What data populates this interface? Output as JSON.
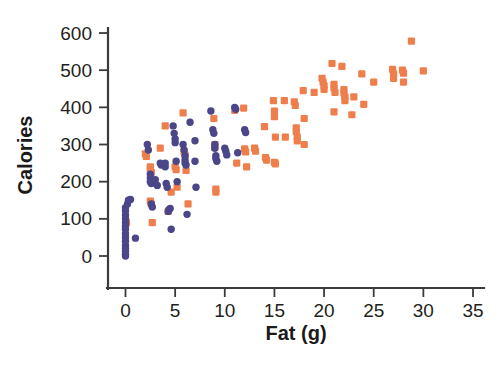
{
  "chart_data": {
    "type": "scatter",
    "title": "",
    "xlabel": "Fat (g)",
    "ylabel": "Calories",
    "xlim": [
      -2.2,
      36.5
    ],
    "ylim": [
      -35,
      630
    ],
    "xticks": [
      0,
      5,
      10,
      15,
      20,
      25,
      30,
      35
    ],
    "yticks": [
      0,
      100,
      200,
      300,
      400,
      500,
      600
    ],
    "xtick_labels": [
      "0",
      "5",
      "10",
      "15",
      "20",
      "25",
      "30",
      "35"
    ],
    "ytick_labels": [
      "0",
      "100",
      "200",
      "300",
      "400",
      "500",
      "600"
    ],
    "grid": false,
    "legend": "none",
    "series": [
      {
        "name": "purple-circles",
        "marker": "circle",
        "color": "#4a4688",
        "points": [
          [
            0,
            0
          ],
          [
            0,
            5
          ],
          [
            0,
            12
          ],
          [
            0,
            20
          ],
          [
            0,
            28
          ],
          [
            0,
            40
          ],
          [
            0,
            50
          ],
          [
            0,
            60
          ],
          [
            0,
            72
          ],
          [
            0,
            80
          ],
          [
            0,
            90
          ],
          [
            0,
            100
          ],
          [
            0,
            110
          ],
          [
            0,
            122
          ],
          [
            0,
            130
          ],
          [
            0.2,
            140
          ],
          [
            0.3,
            150
          ],
          [
            0.5,
            152
          ],
          [
            1.0,
            48
          ],
          [
            2.2,
            300
          ],
          [
            2.3,
            285
          ],
          [
            2.5,
            210
          ],
          [
            2.5,
            200
          ],
          [
            2.5,
            220
          ],
          [
            2.6,
            195
          ],
          [
            2.6,
            140
          ],
          [
            2.7,
            132
          ],
          [
            3.0,
            205
          ],
          [
            3.2,
            190
          ],
          [
            3.5,
            250
          ],
          [
            3.6,
            245
          ],
          [
            4.0,
            250
          ],
          [
            4.0,
            240
          ],
          [
            4.1,
            195
          ],
          [
            4.2,
            185
          ],
          [
            4.3,
            120
          ],
          [
            4.4,
            125
          ],
          [
            4.5,
            128
          ],
          [
            4.6,
            72
          ],
          [
            4.8,
            350
          ],
          [
            4.9,
            330
          ],
          [
            5.0,
            315
          ],
          [
            5.0,
            305
          ],
          [
            5.1,
            255
          ],
          [
            5.2,
            200
          ],
          [
            5.8,
            300
          ],
          [
            5.9,
            285
          ],
          [
            6.0,
            270
          ],
          [
            6.0,
            258
          ],
          [
            6.0,
            250
          ],
          [
            6.1,
            245
          ],
          [
            6.2,
            112
          ],
          [
            6.5,
            360
          ],
          [
            7.0,
            310
          ],
          [
            7.0,
            255
          ],
          [
            7.1,
            185
          ],
          [
            8.6,
            390
          ],
          [
            8.8,
            340
          ],
          [
            8.9,
            330
          ],
          [
            9.0,
            300
          ],
          [
            9.0,
            290
          ],
          [
            9.1,
            270
          ],
          [
            9.1,
            262
          ],
          [
            9.2,
            255
          ],
          [
            10.0,
            290
          ],
          [
            10.1,
            282
          ],
          [
            10.2,
            272
          ],
          [
            11.0,
            400
          ],
          [
            11.1,
            395
          ],
          [
            11.3,
            278
          ],
          [
            12.0,
            340
          ],
          [
            12.1,
            332
          ]
        ]
      },
      {
        "name": "orange-squares",
        "marker": "square",
        "color": "#ee7f4c",
        "points": [
          [
            0.1,
            90
          ],
          [
            2.0,
            275
          ],
          [
            2.1,
            268
          ],
          [
            2.5,
            240
          ],
          [
            2.5,
            232
          ],
          [
            2.6,
            225
          ],
          [
            2.5,
            148
          ],
          [
            2.6,
            140
          ],
          [
            2.7,
            90
          ],
          [
            3.5,
            290
          ],
          [
            4.0,
            350
          ],
          [
            4.3,
            120
          ],
          [
            4.6,
            172
          ],
          [
            5.0,
            240
          ],
          [
            5.1,
            232
          ],
          [
            5.2,
            185
          ],
          [
            5.8,
            385
          ],
          [
            5.9,
            280
          ],
          [
            6.0,
            272
          ],
          [
            6.1,
            230
          ],
          [
            6.3,
            140
          ],
          [
            8.9,
            370
          ],
          [
            9.0,
            300
          ],
          [
            9.0,
            292
          ],
          [
            9.1,
            180
          ],
          [
            9.1,
            172
          ],
          [
            11.0,
            392
          ],
          [
            11.2,
            250
          ],
          [
            11.9,
            398
          ],
          [
            12.0,
            288
          ],
          [
            12.1,
            280
          ],
          [
            12.2,
            240
          ],
          [
            13.0,
            290
          ],
          [
            13.1,
            282
          ],
          [
            14.0,
            348
          ],
          [
            14.1,
            265
          ],
          [
            14.2,
            258
          ],
          [
            14.9,
            418
          ],
          [
            15.0,
            390
          ],
          [
            15.0,
            375
          ],
          [
            15.1,
            320
          ],
          [
            15.0,
            252
          ],
          [
            15.1,
            248
          ],
          [
            16.0,
            418
          ],
          [
            16.1,
            320
          ],
          [
            17.0,
            415
          ],
          [
            17.1,
            405
          ],
          [
            17.2,
            345
          ],
          [
            17.2,
            335
          ],
          [
            17.3,
            320
          ],
          [
            17.3,
            310
          ],
          [
            17.9,
            445
          ],
          [
            18.0,
            370
          ],
          [
            18.0,
            300
          ],
          [
            19.0,
            440
          ],
          [
            19.8,
            478
          ],
          [
            19.9,
            468
          ],
          [
            20.0,
            458
          ],
          [
            20.0,
            448
          ],
          [
            20.8,
            518
          ],
          [
            21.0,
            462
          ],
          [
            21.0,
            452
          ],
          [
            21.1,
            440
          ],
          [
            21.0,
            388
          ],
          [
            21.8,
            510
          ],
          [
            22.0,
            448
          ],
          [
            22.0,
            438
          ],
          [
            22.1,
            428
          ],
          [
            22.1,
            418
          ],
          [
            22.8,
            380
          ],
          [
            23.0,
            428
          ],
          [
            23.8,
            490
          ],
          [
            24.0,
            408
          ],
          [
            25.0,
            468
          ],
          [
            26.9,
            502
          ],
          [
            27.0,
            490
          ],
          [
            27.0,
            478
          ],
          [
            27.9,
            500
          ],
          [
            28.0,
            492
          ],
          [
            28.0,
            468
          ],
          [
            28.8,
            578
          ],
          [
            30.0,
            498
          ]
        ]
      }
    ]
  },
  "axes": {
    "x_title": "Fat (g)",
    "y_title": "Calories",
    "x_tick_labels": [
      "0",
      "5",
      "10",
      "15",
      "20",
      "25",
      "30",
      "35"
    ],
    "y_tick_labels": [
      "0",
      "100",
      "200",
      "300",
      "400",
      "500",
      "600"
    ]
  },
  "colors": {
    "purple": "#4a4688",
    "orange": "#ee7f4c",
    "axis": "#3b3b3b",
    "text": "#231f20",
    "background": "#ffffff"
  }
}
